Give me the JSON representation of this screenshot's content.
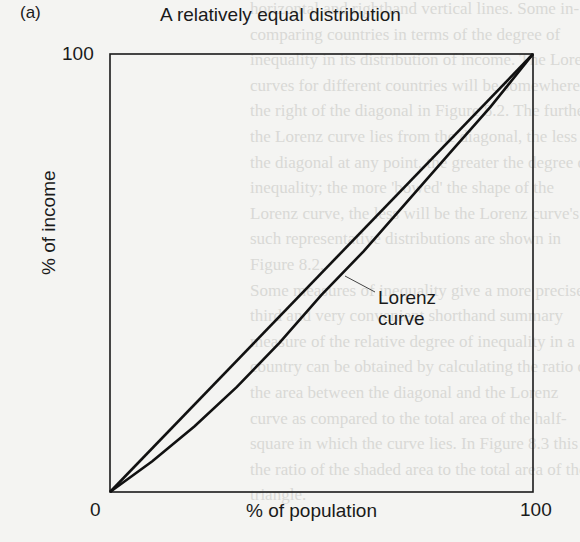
{
  "panel_label": "(a)",
  "chart_data": {
    "type": "line",
    "title": "A relatively equal distribution",
    "xlabel": "% of population",
    "ylabel": "% of income",
    "xlim": [
      0,
      100
    ],
    "ylim": [
      0,
      100
    ],
    "x_ticks": [
      "0",
      "100"
    ],
    "y_ticks": [
      "100"
    ],
    "grid": false,
    "legend": null,
    "series": [
      {
        "name": "Line of perfect equality (diagonal)",
        "x": [
          0,
          100
        ],
        "y": [
          0,
          100
        ]
      },
      {
        "name": "Lorenz curve",
        "x": [
          0,
          10,
          20,
          30,
          40,
          50,
          60,
          70,
          80,
          90,
          100
        ],
        "y": [
          0,
          7,
          15,
          24,
          34,
          45,
          55,
          66,
          77,
          88,
          100
        ]
      }
    ],
    "annotations": [
      {
        "text": "Lorenz curve",
        "points_to": "Lorenz curve",
        "at": [
          53,
          45
        ]
      }
    ]
  },
  "labels": {
    "tick_y100": "100",
    "tick_x0": "0",
    "tick_x100": "100",
    "annotation_line1": "Lorenz",
    "annotation_line2": "curve"
  },
  "background_bleed": [
    "horizontal and righthand vertical lines. Some in-",
    "comparing countries in terms of the degree of",
    "inequality in its distribution of income. The Lorenz",
    "curves for different countries will be somewhere to",
    "the right of the diagonal in Figure 8.2. The further",
    "the Lorenz curve lies from the diagonal, the less",
    "the diagonal at any point, the greater the degree of",
    "inequality; the more 'bowed' the shape of the",
    "Lorenz curve, the less will be the Lorenz curve's",
    "such representative distributions are shown in",
    "Figure 8.2.",
    "Some measures of inequality give a more precise",
    "third and very convenient shorthand summary",
    "measure of the relative degree of inequality in a",
    "country can be obtained by calculating the ratio of",
    "the area between the diagonal and the Lorenz",
    "curve as compared to the total area of the half-",
    "square in which the curve lies. In Figure 8.3 this is",
    "the ratio of the shaded area to the total area of the",
    "triangle."
  ]
}
